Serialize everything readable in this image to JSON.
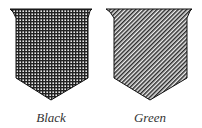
{
  "tinctures": [
    {
      "name": "Black",
      "hatching": "cross-hatch (horizontal and vertical lines)"
    },
    {
      "name": "Green",
      "hatching": "diagonal lines from top-left to bottom-right"
    }
  ],
  "colors": {
    "ink": "#1a1a1a",
    "background": "#ffffff"
  }
}
